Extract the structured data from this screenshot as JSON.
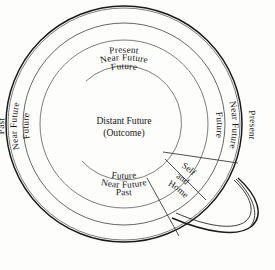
{
  "diagram": {
    "shape": "circle-with-handle",
    "background_color": "#fdfdfc",
    "line_color": "#1a1a1a",
    "inner_line_color": "#6e6e6e",
    "center": {
      "x": 124,
      "y": 124
    },
    "rings": [
      {
        "name": "outer-ring-present",
        "label": "Present",
        "radius": 118
      },
      {
        "name": "ring-near-future",
        "label": "Near Future",
        "radius": 101
      },
      {
        "name": "ring-future",
        "label": "Future",
        "radius": 84
      },
      {
        "name": "core-distant-future",
        "label": "Distant Future",
        "radius": 57
      }
    ],
    "center_text": {
      "line1": "Distant Future",
      "line2": "(Outcome)"
    },
    "labels_top": [
      {
        "name": "top-present",
        "text": "Present"
      },
      {
        "name": "top-near-future",
        "text": "Near Future"
      },
      {
        "name": "top-future",
        "text": "Future"
      }
    ],
    "labels_left": [
      {
        "name": "left-past",
        "text": "Past"
      },
      {
        "name": "left-near-future",
        "text": "Near Future"
      },
      {
        "name": "left-future",
        "text": "Future"
      }
    ],
    "labels_right": [
      {
        "name": "right-future",
        "text": "Future"
      },
      {
        "name": "right-near-future",
        "text": "Near Future"
      },
      {
        "name": "right-present",
        "text": "Present"
      }
    ],
    "labels_bottom": [
      {
        "name": "bottom-future",
        "text": "Future"
      },
      {
        "name": "bottom-near-future",
        "text": "Near Future"
      },
      {
        "name": "bottom-past",
        "text": "Past"
      }
    ],
    "wedge": {
      "name": "self-and-home-wedge",
      "line1": "Self",
      "line2": "and",
      "line3": "Home"
    },
    "handle": {
      "name": "handle",
      "position": "lower-right",
      "label": ""
    }
  }
}
